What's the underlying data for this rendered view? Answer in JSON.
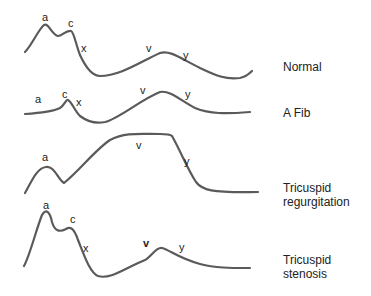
{
  "waveforms": [
    {
      "caption": "Normal",
      "waves": {
        "a": "a",
        "c": "c",
        "x": "x",
        "v": "v",
        "y": "y"
      }
    },
    {
      "caption": "A Fib",
      "waves": {
        "a": "a",
        "c": "c",
        "x": "x",
        "v": "v",
        "y": "y"
      }
    },
    {
      "caption_line1": "Tricuspid",
      "caption_line2": "regurgitation",
      "waves": {
        "a": "a",
        "v": "v",
        "y": "y"
      }
    },
    {
      "caption_line1": "Tricuspid",
      "caption_line2": "stenosis",
      "waves": {
        "a": "a",
        "c": "c",
        "x": "x",
        "v": "v",
        "y": "y"
      }
    }
  ],
  "colors": {
    "curve": "#5a5a5a",
    "text": "#222222",
    "background": "#ffffff"
  }
}
